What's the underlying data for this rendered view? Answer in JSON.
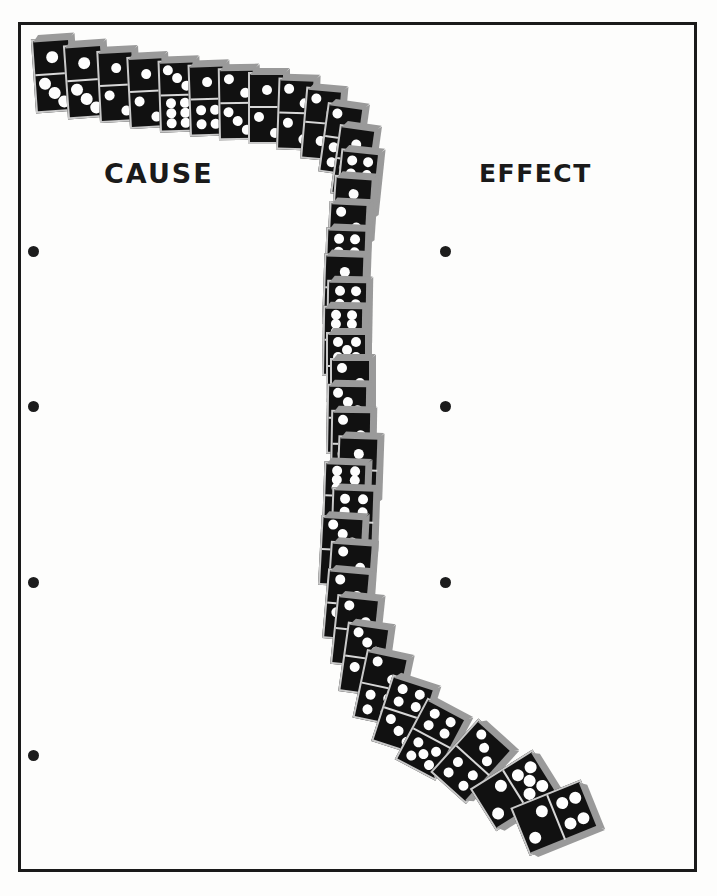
{
  "page": {
    "background_color": "#fdfdfc",
    "border_color": "#1a1a1a",
    "width": 717,
    "height": 896
  },
  "labels": {
    "cause": "CAUSE",
    "effect": "EFFECT"
  },
  "colors": {
    "domino_body": "#111111",
    "domino_pip": "#fdfdfd",
    "domino_edge": "#9a9a9a",
    "domino_outline": "#c9c9c9",
    "punch_dot": "#1c1c1c",
    "text": "#1a1a1a"
  },
  "punch_holes": {
    "left_x": 28,
    "right_x": 440,
    "left_y": [
      246,
      401,
      577,
      750
    ],
    "right_y": [
      246,
      401,
      577,
      730
    ],
    "diameter": 11
  },
  "illustration": {
    "type": "domino-chain",
    "description": "A curving line of standing black dominoes running from upper-left, bending down the middle of the page, and toppling over at the lower right.",
    "dominoes": [
      {
        "x": 36,
        "y": 38,
        "w": 40,
        "h": 74,
        "rot": -4,
        "top_pips": 1,
        "bottom_pips": 3,
        "fallen": false
      },
      {
        "x": 68,
        "y": 44,
        "w": 40,
        "h": 74,
        "rot": -4,
        "top_pips": 1,
        "bottom_pips": 3,
        "fallen": false
      },
      {
        "x": 100,
        "y": 50,
        "w": 38,
        "h": 72,
        "rot": -3,
        "top_pips": 1,
        "bottom_pips": 2,
        "fallen": false
      },
      {
        "x": 130,
        "y": 56,
        "w": 38,
        "h": 72,
        "rot": -3,
        "top_pips": 1,
        "bottom_pips": 2,
        "fallen": false
      },
      {
        "x": 160,
        "y": 60,
        "w": 38,
        "h": 72,
        "rot": -2,
        "top_pips": 3,
        "bottom_pips": 6,
        "fallen": false
      },
      {
        "x": 190,
        "y": 64,
        "w": 38,
        "h": 72,
        "rot": -2,
        "top_pips": 1,
        "bottom_pips": 4,
        "fallen": false
      },
      {
        "x": 219,
        "y": 68,
        "w": 38,
        "h": 72,
        "rot": -1,
        "top_pips": 2,
        "bottom_pips": 3,
        "fallen": false
      },
      {
        "x": 248,
        "y": 72,
        "w": 38,
        "h": 72,
        "rot": 0,
        "top_pips": 1,
        "bottom_pips": 2,
        "fallen": false
      },
      {
        "x": 276,
        "y": 78,
        "w": 38,
        "h": 72,
        "rot": 2,
        "top_pips": 2,
        "bottom_pips": 2,
        "fallen": false
      },
      {
        "x": 300,
        "y": 88,
        "w": 38,
        "h": 72,
        "rot": 5,
        "top_pips": 2,
        "bottom_pips": 1,
        "fallen": false
      },
      {
        "x": 318,
        "y": 104,
        "w": 38,
        "h": 70,
        "rot": 8,
        "top_pips": 2,
        "bottom_pips": 4,
        "fallen": false
      },
      {
        "x": 330,
        "y": 126,
        "w": 38,
        "h": 70,
        "rot": 8,
        "top_pips": 1,
        "bottom_pips": 3,
        "fallen": false
      },
      {
        "x": 334,
        "y": 150,
        "w": 40,
        "h": 70,
        "rot": 6,
        "top_pips": 4,
        "bottom_pips": 2,
        "fallen": false
      },
      {
        "x": 330,
        "y": 176,
        "w": 40,
        "h": 70,
        "rot": 4,
        "top_pips": 1,
        "bottom_pips": 3,
        "fallen": false
      },
      {
        "x": 326,
        "y": 202,
        "w": 40,
        "h": 70,
        "rot": 3,
        "top_pips": 2,
        "bottom_pips": 1,
        "fallen": false
      },
      {
        "x": 324,
        "y": 228,
        "w": 42,
        "h": 70,
        "rot": 2,
        "top_pips": 4,
        "bottom_pips": 2,
        "fallen": false
      },
      {
        "x": 322,
        "y": 254,
        "w": 42,
        "h": 70,
        "rot": 2,
        "top_pips": 1,
        "bottom_pips": 2,
        "fallen": false
      },
      {
        "x": 326,
        "y": 280,
        "w": 42,
        "h": 70,
        "rot": 1,
        "top_pips": 4,
        "bottom_pips": 4,
        "fallen": false
      },
      {
        "x": 322,
        "y": 306,
        "w": 42,
        "h": 70,
        "rot": 1,
        "top_pips": 6,
        "bottom_pips": 3,
        "fallen": false
      },
      {
        "x": 326,
        "y": 332,
        "w": 42,
        "h": 70,
        "rot": 0,
        "top_pips": 5,
        "bottom_pips": 2,
        "fallen": false
      },
      {
        "x": 330,
        "y": 358,
        "w": 42,
        "h": 70,
        "rot": 0,
        "top_pips": 2,
        "bottom_pips": 3,
        "fallen": false
      },
      {
        "x": 326,
        "y": 384,
        "w": 42,
        "h": 70,
        "rot": 1,
        "top_pips": 3,
        "bottom_pips": 1,
        "fallen": false
      },
      {
        "x": 330,
        "y": 410,
        "w": 42,
        "h": 70,
        "rot": 1,
        "top_pips": 2,
        "bottom_pips": 2,
        "fallen": false
      },
      {
        "x": 336,
        "y": 436,
        "w": 42,
        "h": 70,
        "rot": 2,
        "top_pips": 1,
        "bottom_pips": 2,
        "fallen": false
      },
      {
        "x": 322,
        "y": 462,
        "w": 44,
        "h": 70,
        "rot": 2,
        "top_pips": 6,
        "bottom_pips": 1,
        "fallen": false
      },
      {
        "x": 330,
        "y": 488,
        "w": 44,
        "h": 70,
        "rot": 2,
        "top_pips": 4,
        "bottom_pips": 2,
        "fallen": false
      },
      {
        "x": 318,
        "y": 516,
        "w": 44,
        "h": 70,
        "rot": 3,
        "top_pips": 3,
        "bottom_pips": 1,
        "fallen": false
      },
      {
        "x": 326,
        "y": 542,
        "w": 44,
        "h": 70,
        "rot": 4,
        "top_pips": 2,
        "bottom_pips": 2,
        "fallen": false
      },
      {
        "x": 322,
        "y": 570,
        "w": 44,
        "h": 70,
        "rot": 5,
        "top_pips": 2,
        "bottom_pips": 3,
        "fallen": false
      },
      {
        "x": 330,
        "y": 596,
        "w": 44,
        "h": 70,
        "rot": 6,
        "top_pips": 2,
        "bottom_pips": 1,
        "fallen": false
      },
      {
        "x": 338,
        "y": 624,
        "w": 44,
        "h": 70,
        "rot": 8,
        "top_pips": 3,
        "bottom_pips": 2,
        "fallen": false
      },
      {
        "x": 352,
        "y": 652,
        "w": 44,
        "h": 70,
        "rot": 12,
        "top_pips": 2,
        "bottom_pips": 4,
        "fallen": false
      },
      {
        "x": 370,
        "y": 678,
        "w": 46,
        "h": 70,
        "rot": 18,
        "top_pips": 4,
        "bottom_pips": 3,
        "fallen": false
      },
      {
        "x": 392,
        "y": 700,
        "w": 46,
        "h": 70,
        "rot": 28,
        "top_pips": 4,
        "bottom_pips": 5,
        "fallen": true
      },
      {
        "x": 424,
        "y": 716,
        "w": 48,
        "h": 72,
        "rot": 42,
        "top_pips": 3,
        "bottom_pips": 4,
        "fallen": true
      },
      {
        "x": 458,
        "y": 736,
        "w": 50,
        "h": 74,
        "rot": 58,
        "top_pips": 5,
        "bottom_pips": 2,
        "fallen": true
      },
      {
        "x": 494,
        "y": 756,
        "w": 52,
        "h": 76,
        "rot": 68,
        "top_pips": 4,
        "bottom_pips": 2,
        "fallen": true
      }
    ]
  }
}
